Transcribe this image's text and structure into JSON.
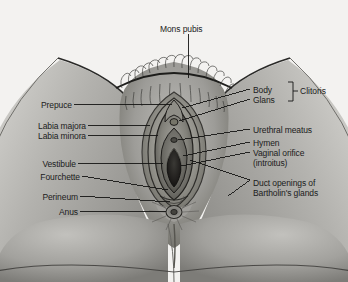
{
  "figure": {
    "title_label": "Mons pubis",
    "group_label": "Clitoris",
    "labels_left": [
      {
        "text": "Prepuce",
        "x": 38,
        "y": 100
      },
      {
        "text": "Labia majora",
        "x": 18,
        "y": 121
      },
      {
        "text": "Labia minora",
        "x": 18,
        "y": 131
      },
      {
        "text": "Vestibule",
        "x": 32,
        "y": 159
      },
      {
        "text": "Fourchette",
        "x": 25,
        "y": 172
      },
      {
        "text": "Perineum",
        "x": 33,
        "y": 192
      },
      {
        "text": "Anus",
        "x": 58,
        "y": 207
      }
    ],
    "labels_right": [
      {
        "text": "Body",
        "x": 253,
        "y": 85
      },
      {
        "text": "Glans",
        "x": 253,
        "y": 95
      },
      {
        "text": "Urethral meatus",
        "x": 253,
        "y": 125
      },
      {
        "text": "Hymen",
        "x": 253,
        "y": 138
      },
      {
        "text": "Vaginal orifice",
        "x": 253,
        "y": 148
      },
      {
        "text": "(introitus)",
        "x": 253,
        "y": 158
      },
      {
        "text": "Duct openings of",
        "x": 253,
        "y": 178
      },
      {
        "text": "Bartholin's glands",
        "x": 253,
        "y": 188
      }
    ],
    "colors": {
      "page_background": "#f2f2f0",
      "ink": "#1b1b1b",
      "skin_mid": "#9a9a96",
      "skin_light": "#c9c8c4",
      "skin_dark": "#5e5d5a"
    }
  }
}
